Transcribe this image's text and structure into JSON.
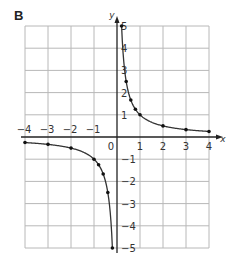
{
  "panel_label": "B",
  "chart_data": {
    "type": "line",
    "title": "",
    "xlabel": "x",
    "ylabel": "y",
    "xlim": [
      -4,
      4
    ],
    "ylim": [
      -5,
      5
    ],
    "grid": true,
    "x_ticks": [
      "-4",
      "-3",
      "-2",
      "-1",
      "1",
      "2",
      "3",
      "4"
    ],
    "y_ticks": [
      "5",
      "4",
      "3",
      "2",
      "1",
      "-1",
      "-2",
      "-3",
      "-4",
      "-5"
    ],
    "origin_label": "0",
    "function": "y = 1/x",
    "series": [
      {
        "name": "positive branch",
        "points": [
          [
            0.2,
            5
          ],
          [
            0.4,
            2.5
          ],
          [
            0.6,
            1.67
          ],
          [
            0.8,
            1.25
          ],
          [
            1,
            1
          ],
          [
            2,
            0.5
          ],
          [
            3,
            0.33
          ],
          [
            4,
            0.25
          ]
        ]
      },
      {
        "name": "negative branch",
        "points": [
          [
            -4,
            -0.25
          ],
          [
            -3,
            -0.33
          ],
          [
            -2,
            -0.5
          ],
          [
            -1,
            -1
          ],
          [
            -0.8,
            -1.25
          ],
          [
            -0.6,
            -1.67
          ],
          [
            -0.4,
            -2.5
          ],
          [
            -0.2,
            -5
          ]
        ]
      }
    ],
    "colors": {
      "grid": "#b8b8b8",
      "axis": "#222222",
      "curve": "#333333",
      "point": "#111111"
    }
  }
}
